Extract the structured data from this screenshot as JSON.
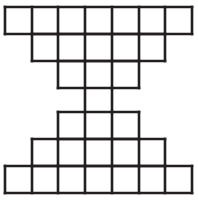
{
  "figure": {
    "name": "hourglass-grid-figure",
    "stroke_color": "#231f20",
    "background_color": "#ffffff",
    "line_width": 2.6,
    "cell_size": 27,
    "origin": {
      "x": 5,
      "y": 7
    },
    "columns": 7,
    "rows": 7,
    "rows_data": [
      {
        "index": 0,
        "label": "top-row-7",
        "start_col": 0,
        "cells": 7,
        "y_top": 7,
        "y_bottom": 34,
        "draw_top": true,
        "draw_bottom": true
      },
      {
        "index": 1,
        "label": "row-5-upper",
        "start_col": 1,
        "cells": 5,
        "y_top": 34,
        "y_bottom": 61,
        "draw_top": true,
        "draw_bottom": true
      },
      {
        "index": 2,
        "label": "row-3-upper",
        "start_col": 2,
        "cells": 3,
        "y_top": 61,
        "y_bottom": 88,
        "draw_top": true,
        "draw_bottom": true
      },
      {
        "index": 3,
        "label": "neck-row-1",
        "start_col": 3,
        "cells": 1,
        "y_top": 88,
        "y_bottom": 112,
        "draw_top": false,
        "draw_bottom": false
      },
      {
        "index": 4,
        "label": "row-3-lower",
        "start_col": 2,
        "cells": 3,
        "y_top": 112,
        "y_bottom": 139,
        "draw_top": true,
        "draw_bottom": true
      },
      {
        "index": 5,
        "label": "row-5-lower",
        "start_col": 1,
        "cells": 5,
        "y_top": 139,
        "y_bottom": 166,
        "draw_top": true,
        "draw_bottom": true
      },
      {
        "index": 6,
        "label": "bottom-row-7",
        "start_col": 0,
        "cells": 7,
        "y_top": 166,
        "y_bottom": 193,
        "draw_top": true,
        "draw_bottom": true
      }
    ],
    "column_x": [
      5,
      32,
      58,
      85,
      112,
      139,
      165,
      192
    ],
    "row_y": [
      7,
      34,
      61,
      88,
      112,
      139,
      166,
      193
    ],
    "total_squares": 31
  }
}
